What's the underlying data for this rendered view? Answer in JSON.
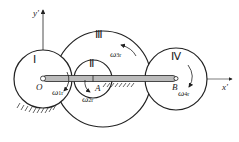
{
  "axes": {
    "y_label": "y'",
    "x_label": "x'"
  },
  "gears": [
    {
      "id": "I",
      "label": "Ⅰ",
      "center_label": "O",
      "omega": "ω",
      "omega_sub": "1r"
    },
    {
      "id": "II",
      "label": "Ⅱ",
      "center_label": "A",
      "omega": "ω",
      "omega_sub": "2r"
    },
    {
      "id": "III",
      "label": "Ⅲ",
      "omega": "ω",
      "omega_sub": "3r"
    },
    {
      "id": "IV",
      "label": "Ⅳ",
      "center_label": "B",
      "omega": "ω",
      "omega_sub": "4r"
    }
  ],
  "colors": {
    "stroke": "#222222",
    "arm_fill": "#bbbbbb"
  }
}
